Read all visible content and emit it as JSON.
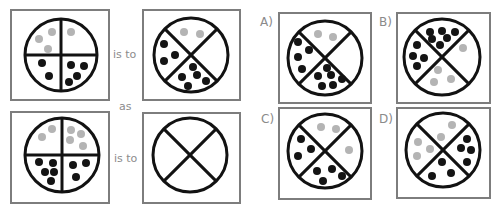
{
  "colors": {
    "box_border": "#7d7d7d",
    "line": "#121212",
    "black_dot": "#141414",
    "gray_dot": "#b4b4b4",
    "text": "#8c8c8c"
  },
  "question": {
    "connectors": {
      "is_to_1": "is to",
      "as": "as",
      "is_to_2": "is to"
    },
    "panels": [
      {
        "name": "question-figure-1",
        "box": [
          11,
          10,
          98,
          90
        ],
        "circle": {
          "cx": 61,
          "cy": 55,
          "r": 36
        },
        "dividers": "plus",
        "dots": [
          [
            39,
            39,
            "g"
          ],
          [
            52,
            32,
            "g"
          ],
          [
            48,
            49,
            "g"
          ],
          [
            71,
            32,
            "g"
          ],
          [
            42,
            63,
            "b"
          ],
          [
            49,
            76,
            "b"
          ],
          [
            71,
            65,
            "b"
          ],
          [
            84,
            66,
            "b"
          ],
          [
            77,
            76,
            "b"
          ],
          [
            69,
            82,
            "b"
          ]
        ]
      },
      {
        "name": "question-figure-2",
        "box": [
          143,
          10,
          97,
          90
        ],
        "circle": {
          "cx": 191,
          "cy": 55,
          "r": 37
        },
        "dividers": "x",
        "dots": [
          [
            184,
            32,
            "g"
          ],
          [
            200,
            34,
            "g"
          ],
          [
            164,
            44,
            "b"
          ],
          [
            175,
            55,
            "b"
          ],
          [
            164,
            61,
            "b"
          ],
          [
            193,
            67,
            "b"
          ],
          [
            197,
            75,
            "b"
          ],
          [
            182,
            77,
            "b"
          ],
          [
            206,
            81,
            "b"
          ],
          [
            188,
            86,
            "b"
          ]
        ]
      },
      {
        "name": "question-figure-3",
        "box": [
          11,
          112,
          98,
          91
        ],
        "circle": {
          "cx": 62,
          "cy": 155,
          "r": 37
        },
        "dividers": "plus",
        "dots": [
          [
            42,
            137,
            "g"
          ],
          [
            52,
            129,
            "g"
          ],
          [
            71,
            130,
            "g"
          ],
          [
            81,
            134,
            "g"
          ],
          [
            70,
            140,
            "g"
          ],
          [
            83,
            146,
            "g"
          ],
          [
            39,
            162,
            "b"
          ],
          [
            53,
            163,
            "b"
          ],
          [
            45,
            172,
            "b"
          ],
          [
            54,
            172,
            "b"
          ],
          [
            51,
            181,
            "b"
          ],
          [
            73,
            165,
            "b"
          ],
          [
            86,
            163,
            "b"
          ],
          [
            76,
            177,
            "b"
          ]
        ]
      },
      {
        "name": "question-figure-4-blank",
        "box": [
          143,
          113,
          97,
          90
        ],
        "circle": {
          "cx": 190,
          "cy": 155,
          "r": 37
        },
        "dividers": "x",
        "dots": []
      }
    ]
  },
  "options": [
    {
      "label": "A)",
      "name": "option-a",
      "label_pos": [
        260,
        26
      ],
      "box": [
        279,
        13,
        92,
        90
      ],
      "circle": {
        "cx": 325,
        "cy": 58,
        "r": 37
      },
      "dividers": "x",
      "dots": [
        [
          318,
          34,
          "g"
        ],
        [
          333,
          37,
          "g"
        ],
        [
          298,
          42,
          "b"
        ],
        [
          309,
          50,
          "b"
        ],
        [
          298,
          57,
          "b"
        ],
        [
          302,
          69,
          "b"
        ],
        [
          327,
          68,
          "b"
        ],
        [
          318,
          76,
          "b"
        ],
        [
          331,
          75,
          "b"
        ],
        [
          342,
          79,
          "b"
        ],
        [
          322,
          86,
          "b"
        ],
        [
          333,
          85,
          "b"
        ]
      ]
    },
    {
      "label": "B)",
      "name": "option-b",
      "label_pos": [
        379,
        26
      ],
      "box": [
        397,
        13,
        93,
        90
      ],
      "circle": {
        "cx": 442,
        "cy": 57,
        "r": 38
      },
      "dividers": "x",
      "dots": [
        [
          430,
          32,
          "b"
        ],
        [
          442,
          31,
          "b"
        ],
        [
          455,
          32,
          "b"
        ],
        [
          432,
          39,
          "b"
        ],
        [
          447,
          38,
          "b"
        ],
        [
          440,
          45,
          "b"
        ],
        [
          417,
          45,
          "b"
        ],
        [
          413,
          56,
          "b"
        ],
        [
          424,
          58,
          "b"
        ],
        [
          417,
          66,
          "b"
        ],
        [
          463,
          48,
          "g"
        ],
        [
          438,
          70,
          "g"
        ],
        [
          451,
          79,
          "g"
        ],
        [
          434,
          82,
          "g"
        ]
      ]
    },
    {
      "label": "C)",
      "name": "option-c",
      "label_pos": [
        261,
        123
      ],
      "box": [
        279,
        108,
        92,
        91
      ],
      "circle": {
        "cx": 325,
        "cy": 151,
        "r": 37
      },
      "dividers": "x",
      "dots": [
        [
          321,
          127,
          "g"
        ],
        [
          336,
          129,
          "g"
        ],
        [
          301,
          139,
          "b"
        ],
        [
          311,
          149,
          "b"
        ],
        [
          298,
          156,
          "b"
        ],
        [
          349,
          150,
          "g"
        ],
        [
          317,
          171,
          "b"
        ],
        [
          332,
          169,
          "b"
        ],
        [
          342,
          176,
          "b"
        ],
        [
          323,
          181,
          "b"
        ]
      ]
    },
    {
      "label": "D)",
      "name": "option-d",
      "label_pos": [
        379,
        123
      ],
      "box": [
        397,
        108,
        93,
        90
      ],
      "circle": {
        "cx": 443,
        "cy": 150,
        "r": 37
      },
      "dividers": "x",
      "dots": [
        [
          452,
          125,
          "g"
        ],
        [
          441,
          137,
          "g"
        ],
        [
          418,
          142,
          "g"
        ],
        [
          430,
          149,
          "g"
        ],
        [
          417,
          156,
          "g"
        ],
        [
          467,
          139,
          "b"
        ],
        [
          461,
          148,
          "b"
        ],
        [
          471,
          150,
          "b"
        ],
        [
          467,
          162,
          "b"
        ],
        [
          442,
          162,
          "b"
        ],
        [
          451,
          173,
          "b"
        ],
        [
          432,
          176,
          "b"
        ]
      ]
    }
  ]
}
